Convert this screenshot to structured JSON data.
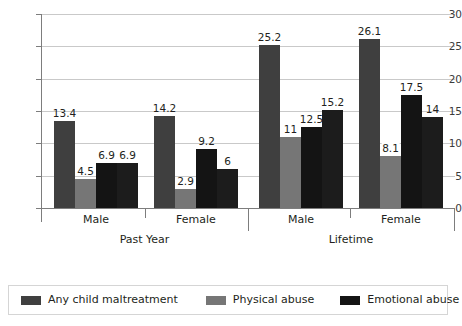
{
  "chart_data": {
    "type": "bar",
    "title": "",
    "xlabel": "",
    "ylabel": "",
    "ylim": [
      0,
      30
    ],
    "yticks": [
      0,
      5,
      10,
      15,
      20,
      25,
      30
    ],
    "grid": true,
    "legend_position": "bottom",
    "categories": [
      "Male",
      "Female",
      "Male",
      "Female"
    ],
    "group_labels": [
      "Past Year",
      "Lifetime"
    ],
    "series": [
      {
        "name": "Any child maltreatment",
        "color": "#3f3f3f",
        "values": [
          13.4,
          14.2,
          25.2,
          26.1
        ],
        "labels": [
          "13.4",
          "14.2",
          "25.2",
          "26.1"
        ]
      },
      {
        "name": "Physical abuse",
        "color": "#767676",
        "values": [
          4.5,
          2.9,
          11,
          8.1
        ],
        "labels": [
          "4.5",
          "2.9",
          "11",
          "8.1"
        ]
      },
      {
        "name": "Emotional abuse",
        "color": "#141414",
        "values": [
          6.9,
          9.2,
          12.5,
          17.5
        ],
        "labels": [
          "6.9",
          "9.2",
          "12.5",
          "17.5"
        ]
      },
      {
        "name": "Neglect",
        "color": "#1c1c1c",
        "values": [
          6.9,
          6,
          15.2,
          14
        ],
        "labels": [
          "6.9",
          "6",
          "15.2",
          "14"
        ]
      }
    ]
  },
  "axis": {
    "y_tick_0": "0",
    "y_tick_1": "5",
    "y_tick_2": "10",
    "y_tick_3": "15",
    "y_tick_4": "20",
    "y_tick_5": "25",
    "y_tick_6": "30"
  },
  "categories": {
    "cat_0": "Male",
    "cat_1": "Female",
    "cat_2": "Male",
    "cat_3": "Female",
    "grp_0": "Past Year",
    "grp_1": "Lifetime"
  },
  "legend": {
    "item_0": "Any child maltreatment",
    "item_1": "Physical abuse",
    "item_2": "Emotional abuse",
    "item_3": "Neglect"
  }
}
